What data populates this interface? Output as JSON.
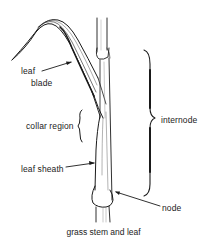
{
  "diagram": {
    "caption": "grass stem and leaf",
    "labels": {
      "leaf": "leaf",
      "blade": "blade",
      "collar_region": "collar region",
      "leaf_sheath": "leaf sheath",
      "internode": "internode",
      "node": "node"
    },
    "colors": {
      "ink": "#1a1a1a",
      "background": "#ffffff"
    }
  }
}
